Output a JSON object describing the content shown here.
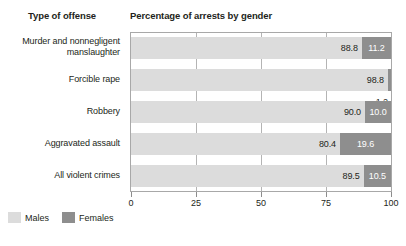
{
  "headers": {
    "category_header": "Type of offense",
    "chart_title": "Percentage of arrests by gender"
  },
  "legend": {
    "males_label": "Males",
    "females_label": "Females",
    "males_color": "#dcdcdc",
    "females_color": "#8e8e8e"
  },
  "chart_data": {
    "type": "bar",
    "orientation": "horizontal",
    "stacked": true,
    "title": "Percentage of arrests by gender",
    "xlabel": "",
    "ylabel": "Type of offense",
    "xlim": [
      0,
      100
    ],
    "xticks": [
      "0",
      "25",
      "50",
      "75",
      "100"
    ],
    "grid": true,
    "legend_position": "bottom-left",
    "categories": [
      "Murder and nonnegligent manslaughter",
      "Forcible rape",
      "Robbery",
      "Aggravated assault",
      "All violent crimes"
    ],
    "category_lines": [
      [
        "Murder and nonnegligent",
        "manslaughter"
      ],
      [
        "Forcible rape"
      ],
      [
        "Robbery"
      ],
      [
        "Aggravated assault"
      ],
      [
        "All violent crimes"
      ]
    ],
    "series": [
      {
        "name": "Males",
        "color": "#dcdcdc",
        "values": [
          88.8,
          98.8,
          90.0,
          80.4,
          89.5
        ],
        "labels": [
          "88.8",
          "98.8",
          "90.0",
          "80.4",
          "89.5"
        ]
      },
      {
        "name": "Females",
        "color": "#8e8e8e",
        "values": [
          11.2,
          1.2,
          10.0,
          19.6,
          10.5
        ],
        "labels": [
          "11.2",
          "1.2",
          "10.0",
          "19.6",
          "10.5"
        ]
      }
    ]
  },
  "rows": [
    {
      "male_label": "88.8",
      "female_label": "11.2",
      "male_pct": 88.8,
      "female_pct": 11.2,
      "female_label_outside": false
    },
    {
      "male_label": "98.8",
      "female_label": "1.2",
      "male_pct": 98.8,
      "female_pct": 1.2,
      "female_label_outside": true
    },
    {
      "male_label": "90.0",
      "female_label": "10.0",
      "male_pct": 90.0,
      "female_pct": 10.0,
      "female_label_outside": false
    },
    {
      "male_label": "80.4",
      "female_label": "19.6",
      "male_pct": 80.4,
      "female_pct": 19.6,
      "female_label_outside": false
    },
    {
      "male_label": "89.5",
      "female_label": "10.5",
      "male_pct": 89.5,
      "female_pct": 10.5,
      "female_label_outside": false
    }
  ]
}
